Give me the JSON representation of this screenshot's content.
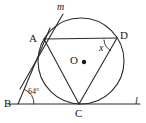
{
  "figure": {
    "kind": "circle-geometry-diagram",
    "canvas": {
      "width": 146,
      "height": 123
    },
    "stroke_color": "#2b2b2b",
    "background_color": "#ffffff"
  },
  "labels": {
    "point_a": "A",
    "point_b": "B",
    "point_c": "C",
    "point_d": "D",
    "center_o": "O",
    "line_m": "m",
    "line_l": "l",
    "angle_b": "64°",
    "angle_d": "x"
  },
  "geometry": {
    "circle": {
      "cx": 81,
      "cy": 61,
      "r": 43
    },
    "points": {
      "A": {
        "x": 44,
        "y": 39
      },
      "B": {
        "x": 18,
        "y": 104
      },
      "C": {
        "x": 79,
        "y": 104
      },
      "D": {
        "x": 117,
        "y": 38
      },
      "O": {
        "x": 81,
        "y": 61
      }
    },
    "segments": [
      {
        "name": "chord-AD",
        "from": "A",
        "to": "D"
      },
      {
        "name": "chord-AC",
        "from": "A",
        "to": "C"
      },
      {
        "name": "chord-CD",
        "from": "C",
        "to": "D"
      },
      {
        "name": "secant-BA",
        "from": "B",
        "to": "A"
      }
    ],
    "lines": {
      "tangent_l": {
        "x1": 10,
        "y1": 104,
        "x2": 139,
        "y2": 104
      },
      "line_m": {
        "x1": 22,
        "y1": 86,
        "x2": 64,
        "y2": 13
      }
    },
    "angle_marks": [
      {
        "name": "angle-at-b",
        "vertex": "B",
        "value": "64°",
        "radius": 16
      },
      {
        "name": "angle-at-d",
        "vertex": "D",
        "value": "x",
        "radius": 13
      }
    ]
  }
}
